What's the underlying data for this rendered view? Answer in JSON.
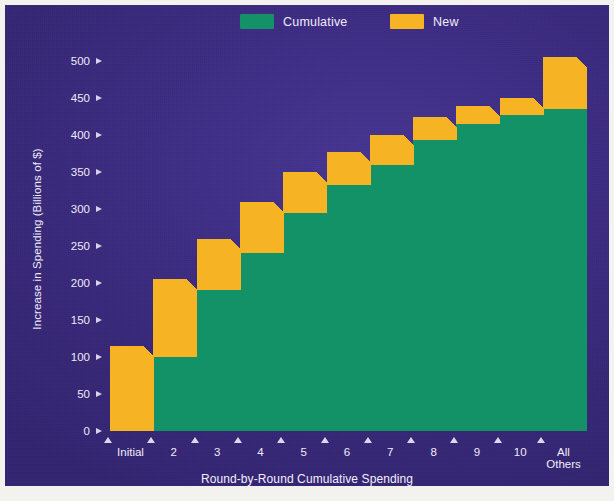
{
  "legend": {
    "position": "top-center",
    "items": [
      {
        "label": "Cumulative",
        "color": "#139167",
        "name": "cumulative"
      },
      {
        "label": "New",
        "color": "#f6b425",
        "name": "new"
      }
    ]
  },
  "axes": {
    "y_label": "Increase in Spending (Billions of $)",
    "x_label": "Round-by-Round Cumulative Spending",
    "y_ticks": [
      "500",
      "450",
      "400",
      "350",
      "300",
      "250",
      "200",
      "150",
      "100",
      "50",
      "0"
    ]
  },
  "colors": {
    "background": "#3d2c83",
    "cumulative": "#139167",
    "cumulative_side": "#0d6d4d",
    "new": "#f6b425",
    "new_side": "#c98d16",
    "text": "#efeaf8"
  },
  "chart_data": {
    "type": "bar",
    "title": "",
    "subtitle": "",
    "xlabel": "Round-by-Round Cumulative Spending",
    "ylabel": "Increase in Spending (Billions of $)",
    "ylim": [
      0,
      500
    ],
    "yticks": [
      0,
      50,
      100,
      150,
      200,
      250,
      300,
      350,
      400,
      450,
      500
    ],
    "grid": false,
    "stacked": true,
    "legend": [
      "Cumulative",
      "New"
    ],
    "categories": [
      "Initial",
      "2",
      "3",
      "4",
      "5",
      "6",
      "7",
      "8",
      "9",
      "10",
      "All Others"
    ],
    "series": [
      {
        "name": "Cumulative",
        "values": [
          0,
          100,
          190,
          240,
          295,
          333,
          360,
          393,
          415,
          427,
          435
        ]
      },
      {
        "name": "New",
        "values": [
          100,
          90,
          55,
          55,
          40,
          29,
          25,
          17,
          9,
          8,
          55
        ]
      }
    ],
    "totals": [
      100,
      190,
      245,
      295,
      335,
      362,
      385,
      410,
      424,
      435,
      490
    ]
  }
}
